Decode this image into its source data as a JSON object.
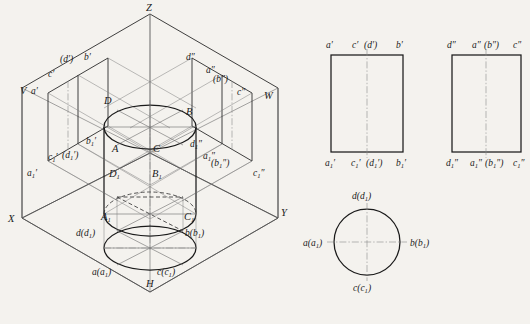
{
  "figure": {
    "background_color": "#f4f2ee",
    "line_color": "#1a1a1a",
    "thin_line_color": "#555555",
    "center_line_color": "#777777"
  },
  "isometric": {
    "axis_labels": {
      "z": "Z",
      "x": "X",
      "y": "Y",
      "v": "V",
      "w": "W",
      "h": "H"
    },
    "solid_top_points": {
      "d": "D",
      "b": "B",
      "a": "A",
      "c": "C"
    },
    "solid_bottom_points": {
      "d1": "D",
      "d1_sub": "1",
      "b1": "B",
      "b1_sub": "1",
      "a1": "A",
      "a1_sub": "1",
      "c1": "C",
      "c1_sub": "1"
    },
    "v_plane_top": {
      "a_prime": "a′",
      "c_prime": "c′",
      "d_prime": "(d′)",
      "b_prime": "b′"
    },
    "v_plane_bottom": {
      "a1_prime": "a",
      "a1_prime_sub": "1",
      "a1_prime_mark": "′",
      "c1_prime": "c",
      "c1_prime_sub": "1",
      "c1_prime_mark": "′",
      "d1_prime": "(d",
      "d1_prime_sub": "1",
      "d1_prime_mark": "′)",
      "b1_prime": "b",
      "b1_prime_sub": "1",
      "b1_prime_mark": "′"
    },
    "w_plane_top": {
      "d_dprime": "d″",
      "a_dprime": "a″",
      "b_dprime": "(b″)",
      "c_dprime": "c″"
    },
    "w_plane_bottom": {
      "d1_dprime": "d",
      "d1_dprime_sub": "1",
      "d1_dprime_mark": "″",
      "a1_dprime": "a",
      "a1_dprime_sub": "1",
      "a1_dprime_mark": "″",
      "b1_dprime": "(b",
      "b1_dprime_sub": "1",
      "b1_dprime_mark": "″)",
      "c1_dprime": "c",
      "c1_dprime_sub": "1",
      "c1_dprime_mark": "″"
    },
    "h_plane_points": {
      "d": "d(d",
      "d_sub": "1",
      "d_close": ")",
      "b": "b(b",
      "b_sub": "1",
      "b_close": ")",
      "a": "a(a",
      "a_sub": "1",
      "a_close": ")",
      "c": "c(c",
      "c_sub": "1",
      "c_close": ")"
    }
  },
  "projection_front": {
    "name": "front-view-rectangle",
    "top_labels": {
      "left": "a′",
      "center_c": "c′",
      "center_d": "(d′)",
      "right": "b′"
    },
    "bottom_labels": {
      "left": "a",
      "left_sub": "1",
      "left_mark": "′",
      "center_c": "c",
      "center_c_sub": "1",
      "center_c_mark": "′",
      "center_d": "(d",
      "center_d_sub": "1",
      "center_d_mark": "′)",
      "right": "b",
      "right_sub": "1",
      "right_mark": "′"
    }
  },
  "projection_side": {
    "name": "side-view-rectangle",
    "top_labels": {
      "left": "d″",
      "center_a": "a″",
      "center_b": "(b″)",
      "right": "c″"
    },
    "bottom_labels": {
      "left": "d",
      "left_sub": "1",
      "left_mark": "″",
      "center_a": "a",
      "center_a_sub": "1",
      "center_a_mark": "″",
      "center_b": "(b",
      "center_b_sub": "1",
      "center_b_mark": "″)",
      "right": "c",
      "right_sub": "1",
      "right_mark": "″"
    }
  },
  "projection_top": {
    "name": "top-view-circle",
    "labels": {
      "top": "d(d",
      "top_sub": "1",
      "top_close": ")",
      "left": "a(a",
      "left_sub": "1",
      "left_close": ")",
      "right": "b(b",
      "right_sub": "1",
      "right_close": ")",
      "bottom": "c(c",
      "bottom_sub": "1",
      "bottom_close": ")"
    }
  }
}
